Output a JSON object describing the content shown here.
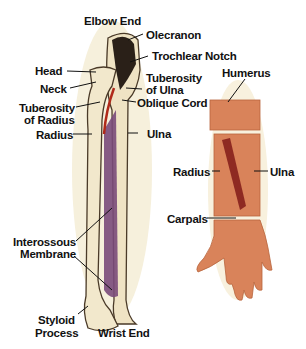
{
  "figure": {
    "left_panel": {
      "subject": "Radius and Ulna bones (anterior view)",
      "labels": {
        "elbow_end": "Elbow End",
        "olecranon": "Olecranon",
        "trochlear_notch": "Trochlear Notch",
        "head": "Head",
        "neck": "Neck",
        "tuberosity_ulna_1": "Tuberosity",
        "tuberosity_ulna_2": "of Ulna",
        "tuberosity_radius_1": "Tuberosity",
        "tuberosity_radius_2": "of Radius",
        "oblique_cord": "Oblique Cord",
        "radius": "Radius",
        "ulna": "Ulna",
        "interossous_1": "Interossous",
        "interossous_2": "Membrane",
        "styloid_1": "Styloid",
        "styloid_2": "Process",
        "wrist_end": "Wrist End"
      }
    },
    "right_panel": {
      "subject": "Forearm with hand",
      "labels": {
        "humerus": "Humerus",
        "radius": "Radius",
        "ulna": "Ulna",
        "carpals": "Carpals"
      }
    },
    "colors": {
      "bone": "#efe3c4",
      "bone_shadow": "#c9b487",
      "membrane": "#7a4a7a",
      "artery": "#b02a1a",
      "skin": "#d9835a",
      "skin_dark": "#b8643c",
      "muscle": "#8e2a22",
      "glow": "#f3ecd4"
    }
  }
}
